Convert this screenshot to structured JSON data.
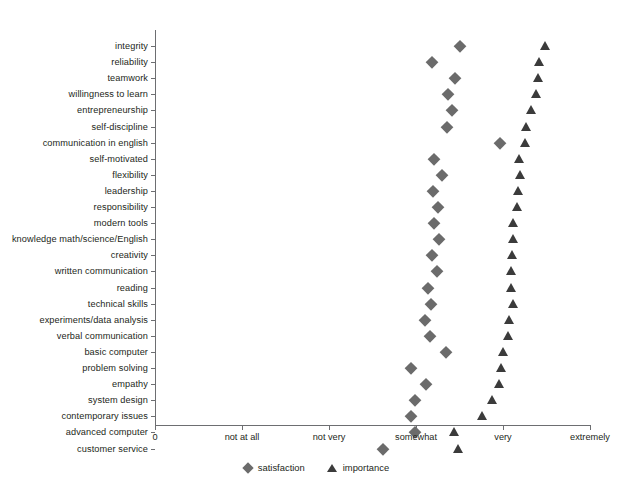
{
  "chart_data": {
    "type": "scatter",
    "title": "",
    "xlabel": "",
    "ylabel": "",
    "grid": false,
    "legend_position": "bottom-center",
    "x_ticks": [
      {
        "value": 0,
        "label": "0"
      },
      {
        "value": 1,
        "label": "not at all"
      },
      {
        "value": 2,
        "label": "not very"
      },
      {
        "value": 3,
        "label": "somewhat"
      },
      {
        "value": 4,
        "label": "very"
      },
      {
        "value": 5,
        "label": "extremely"
      }
    ],
    "xlim": [
      0,
      5
    ],
    "categories": [
      "integrity",
      "reliability",
      "teamwork",
      "willingness to learn",
      "entrepreneurship",
      "self-discipline",
      "communication in english",
      "self-motivated",
      "flexibility",
      "leadership",
      "responsibility",
      "modern tools",
      "knowledge math/science/English",
      "creativity",
      "written communication",
      "reading",
      "technical skills",
      "experiments/data analysis",
      "verbal communication",
      "basic computer",
      "problem solving",
      "empathy",
      "system design",
      "contemporary issues",
      "advanced computer",
      "customer service"
    ],
    "series": [
      {
        "name": "satisfaction",
        "marker": "diamond",
        "color": "#6b6b6b",
        "values": [
          3.51,
          3.18,
          3.45,
          3.37,
          3.41,
          3.36,
          3.96,
          3.21,
          3.3,
          3.2,
          3.25,
          3.21,
          3.27,
          3.18,
          3.24,
          3.14,
          3.17,
          3.1,
          3.16,
          3.35,
          2.94,
          3.11,
          2.99,
          2.94,
          2.99,
          2.62
        ]
      },
      {
        "name": "importance",
        "marker": "triangle",
        "color": "#3b3b3b",
        "values": [
          4.48,
          4.41,
          4.4,
          4.38,
          4.32,
          4.26,
          4.25,
          4.18,
          4.19,
          4.17,
          4.16,
          4.12,
          4.11,
          4.1,
          4.09,
          4.09,
          4.12,
          4.07,
          4.06,
          4.0,
          3.98,
          3.95,
          3.87,
          3.76,
          3.44,
          3.48
        ]
      }
    ]
  },
  "legend": {
    "items": [
      {
        "label": "satisfaction",
        "marker": "diamond"
      },
      {
        "label": "importance",
        "marker": "triangle"
      }
    ]
  }
}
